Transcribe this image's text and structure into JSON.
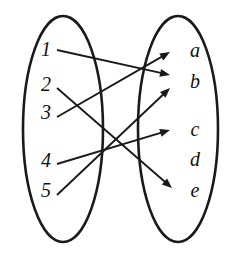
{
  "diagram": {
    "type": "function-mapping-diagram",
    "stroke_color": "#1a1a1a",
    "background_color": "#ffffff",
    "label_color": "#111111",
    "domain": {
      "name": "domain-set",
      "shape": "ellipse",
      "center": {
        "cx": 63,
        "cy": 129
      },
      "radii": {
        "rx": 40,
        "ry": 113
      },
      "elements": [
        {
          "id": "1",
          "label": "1",
          "x": 46,
          "y": 51
        },
        {
          "id": "2",
          "label": "2",
          "x": 46,
          "y": 86
        },
        {
          "id": "3",
          "label": "3",
          "x": 46,
          "y": 114
        },
        {
          "id": "4",
          "label": "4",
          "x": 46,
          "y": 162
        },
        {
          "id": "5",
          "label": "5",
          "x": 46,
          "y": 192
        }
      ]
    },
    "codomain": {
      "name": "codomain-set",
      "shape": "ellipse",
      "center": {
        "cx": 178,
        "cy": 129
      },
      "radii": {
        "rx": 40,
        "ry": 113
      },
      "elements": [
        {
          "id": "a",
          "label": "a",
          "x": 195,
          "y": 52
        },
        {
          "id": "b",
          "label": "b",
          "x": 195,
          "y": 83
        },
        {
          "id": "c",
          "label": "c",
          "x": 195,
          "y": 131
        },
        {
          "id": "d",
          "label": "d",
          "x": 195,
          "y": 161
        },
        {
          "id": "e",
          "label": "e",
          "x": 195,
          "y": 192
        }
      ]
    },
    "arrows": [
      {
        "id": "arrow-1-b",
        "from": "1",
        "to": "b",
        "x1": 57,
        "y1": 50,
        "x2": 170,
        "y2": 75
      },
      {
        "id": "arrow-2-e",
        "from": "2",
        "to": "e",
        "x1": 57,
        "y1": 88,
        "x2": 172,
        "y2": 188
      },
      {
        "id": "arrow-3-a",
        "from": "3",
        "to": "a",
        "x1": 57,
        "y1": 117,
        "x2": 170,
        "y2": 52
      },
      {
        "id": "arrow-4-c",
        "from": "4",
        "to": "c",
        "x1": 57,
        "y1": 164,
        "x2": 170,
        "y2": 130
      },
      {
        "id": "arrow-5-b",
        "from": "5",
        "to": "b",
        "x1": 57,
        "y1": 195,
        "x2": 170,
        "y2": 88
      }
    ],
    "unmapped_codomain_elements": [
      "d"
    ],
    "arrowhead": {
      "length": 10,
      "half_width": 4
    }
  }
}
